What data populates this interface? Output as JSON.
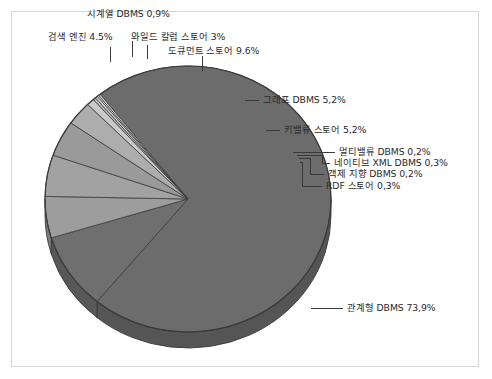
{
  "chart_data": {
    "type": "pie",
    "title": "",
    "subtitle": "",
    "xlabel": "",
    "ylabel": "",
    "legend_position": "none",
    "grid": false,
    "value_suffix": "%",
    "decimal_separator": ",",
    "categories": [
      "관계형 DBMS",
      "도큐먼트 스토어",
      "키밸류 스토어",
      "그래프 DBMS",
      "검색 엔진",
      "와일드 칼럼 스토어",
      "시계열 DBMS",
      "RDF 스토어",
      "네이티브 XML DBMS",
      "멀티밸류 DBMS",
      "객제 지향 DBMS"
    ],
    "values": [
      73.9,
      9.6,
      5.2,
      5.2,
      4.5,
      3.0,
      0.9,
      0.3,
      0.3,
      0.2,
      0.2
    ],
    "slices": [
      {
        "id": "relational",
        "label": "관계형 DBMS 73,9%",
        "name": "관계형 DBMS",
        "value": 73.9,
        "color": "#6c6c6c",
        "side_color": "#555555"
      },
      {
        "id": "document-store",
        "label": "도큐먼트 스토어 9.6%",
        "name": "도큐먼트 스토어",
        "value": 9.6,
        "color": "#6f6f6f",
        "side_color": "#585858"
      },
      {
        "id": "key-value-store",
        "label": "키밸류 스토어 5,2%",
        "name": "키밸류 스토어",
        "value": 5.2,
        "color": "#9d9d9d",
        "side_color": "#7d7d7d"
      },
      {
        "id": "graph-dbms",
        "label": "그래프 DBMS 5,2%",
        "name": "그래프 DBMS",
        "value": 5.2,
        "color": "#a2a2a2",
        "side_color": "#828282"
      },
      {
        "id": "search-engine",
        "label": "검색 엔진 4.5%",
        "name": "검색 엔진",
        "value": 4.5,
        "color": "#9a9a9a",
        "side_color": "#7a7a7a"
      },
      {
        "id": "wide-column-store",
        "label": "와일드 칼럼 스토어 3%",
        "name": "와일드 칼럼 스토어",
        "value": 3.0,
        "color": "#adadad",
        "side_color": "#8c8c8c"
      },
      {
        "id": "time-series-dbms",
        "label": "시계열 DBMS 0,9%",
        "name": "시계열 DBMS",
        "value": 0.9,
        "color": "#c9c9c9",
        "side_color": "#a5a5a5"
      },
      {
        "id": "rdf-store",
        "label": "RDF 스토어 0,3%",
        "name": "RDF 스토어",
        "value": 0.3,
        "color": "#bdbdbd",
        "side_color": "#9a9a9a"
      },
      {
        "id": "native-xml-dbms",
        "label": "네이티브 XML DBMS 0,3%",
        "name": "네이티브 XML DBMS",
        "value": 0.3,
        "color": "#cfcfcf",
        "side_color": "#aaaaaa"
      },
      {
        "id": "multivalue-dbms",
        "label": "멀티밸류 DBMS 0,2%",
        "name": "멀티밸류 DBMS",
        "value": 0.2,
        "color": "#dadada",
        "side_color": "#b3b3b3"
      },
      {
        "id": "object-oriented-dbms",
        "label": "객제 지향 DBMS 0,2%",
        "name": "객제 지향 DBMS",
        "value": 0.2,
        "color": "#e2e2e2",
        "side_color": "#bbbbbb"
      }
    ]
  },
  "labels": {
    "time_series": "시계열 DBMS 0,9%",
    "search_engine": "검색 엔진 4.5%",
    "wide_column": "와일드 칼럼 스토어 3%",
    "document_store": "도큐먼트 스토어 9.6%",
    "graph_dbms": "그래프 DBMS 5,2%",
    "key_value": "키밸류 스토어 5,2%",
    "multivalue": "멀티밸류 DBMS 0,2%",
    "native_xml": "네이티브 XML DBMS 0,3%",
    "object_oriented": "객제 지향 DBMS 0,2%",
    "rdf_store": "RDF 스토어 0,3%",
    "relational": "관계형 DBMS 73,9%"
  },
  "style": {
    "frame_color": "#d8d8d8",
    "leader_color": "#3a3a3a",
    "text_color": "#2a2a2a",
    "background": "#ffffff",
    "pie_outline": "#3b3b3b"
  }
}
